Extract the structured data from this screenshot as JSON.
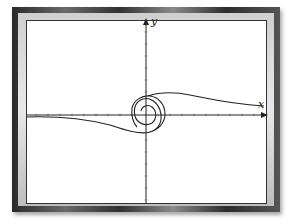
{
  "figure": {
    "axis_labels": {
      "x": "x",
      "y": "y"
    },
    "curve_description": "spiral around origin with tails extending to left (below x-axis) and right (above x-axis)",
    "colors": {
      "curve": "#222222",
      "axes": "#222222",
      "frame": "#3a3a3a",
      "background": "#ffffff"
    }
  }
}
